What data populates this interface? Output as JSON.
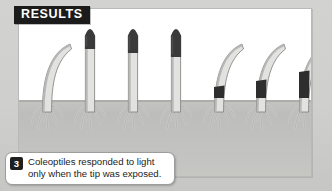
{
  "figure": {
    "section_label": "RESULTS",
    "caption": {
      "number": "3",
      "text": "Coleoptiles responded to light only when the tip was exposed."
    }
  },
  "colors": {
    "panel_background": "#ffffff",
    "outer_background": "#cfcfcd",
    "soil": "#c3c3c1",
    "stem_light": "#e2e2e0",
    "stem_shade": "#b4b4b2",
    "stem_outline": "#7c7c7a",
    "cap_dark": "#3a3a3a",
    "band_dark": "#2e2e2e",
    "root": "#c9c9c7",
    "tag_background": "#1b1b1b",
    "tag_text": "#ffffff",
    "badge_background": "#1f1f1f"
  },
  "scene": {
    "soil_line_y": 91,
    "plants": [
      {
        "id": "plant-1",
        "x": 14,
        "form": "curved",
        "covering": "none",
        "covering_height": 0,
        "description": "uncapped coleoptile bent toward the light"
      },
      {
        "id": "plant-2",
        "x": 57,
        "form": "straight",
        "covering": "tip-cap",
        "covering_height": 22,
        "description": "opaque cap over tip, no bending"
      },
      {
        "id": "plant-3",
        "x": 100,
        "form": "straight",
        "covering": "tip-cap",
        "covering_height": 26,
        "description": "opaque cap over tip, no bending"
      },
      {
        "id": "plant-4",
        "x": 143,
        "form": "straight",
        "covering": "tip-cap",
        "covering_height": 30,
        "description": "opaque cap over tip, no bending"
      },
      {
        "id": "plant-5",
        "x": 186,
        "form": "curved",
        "covering": "base-band",
        "covering_height": 11,
        "description": "opaque band below tip, bends toward light"
      },
      {
        "id": "plant-6",
        "x": 228,
        "form": "curved",
        "covering": "base-band",
        "covering_height": 17,
        "description": "opaque band below tip, bends toward light"
      },
      {
        "id": "plant-7",
        "x": 271,
        "form": "curved",
        "covering": "base-band",
        "covering_height": 26,
        "description": "opaque band below tip, bends toward light"
      }
    ]
  }
}
